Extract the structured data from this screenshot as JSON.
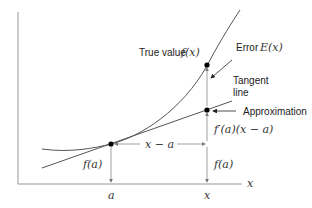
{
  "diagram": {
    "labels": {
      "true_value": "True value",
      "true_value_math": "f(x)",
      "error": "Error",
      "error_math": "E(x)",
      "tangent_line_1": "Tangent",
      "tangent_line_2": "line",
      "approximation": "Approximation",
      "derivative_term": "f′(a)(x − a)",
      "horizontal_span": "x − a",
      "fa_left": "f(a)",
      "fa_right": "f(a)",
      "x_axis": "x",
      "tick_a": "a",
      "tick_x": "x"
    },
    "colors": {
      "curve": "#555555",
      "axes": "#999999",
      "points": "#000000",
      "guides": "#888888"
    }
  }
}
